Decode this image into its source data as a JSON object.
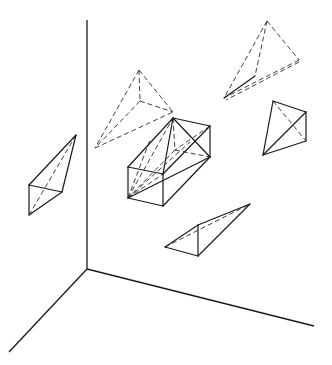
{
  "diagram": {
    "colors": {
      "line": "#1a1a1a",
      "background": "#ffffff"
    },
    "axes": {
      "origin": [
        87,
        269
      ],
      "vertical_top": [
        87,
        20
      ],
      "left_end": [
        9,
        352
      ],
      "right_end": [
        314,
        326
      ]
    },
    "shapes": [
      {
        "id": "left-tetrahedron",
        "solid": [
          [
            [
              76,
              135
            ],
            [
              29,
              185
            ]
          ],
          [
            [
              29,
              185
            ],
            [
              62,
              192
            ]
          ],
          [
            [
              62,
              192
            ],
            [
              76,
              135
            ]
          ],
          [
            [
              29,
              185
            ],
            [
              29,
              215
            ]
          ],
          [
            [
              29,
              215
            ],
            [
              62,
              192
            ]
          ]
        ],
        "dashed": [
          [
            [
              76,
              135
            ],
            [
              29,
              215
            ]
          ]
        ]
      },
      {
        "id": "dashed-tetrahedron-center",
        "solid": [],
        "dashed": [
          [
            [
              139,
              70
            ],
            [
              140,
              101
            ]
          ],
          [
            [
              139,
              70
            ],
            [
              173,
              112
            ]
          ],
          [
            [
              139,
              70
            ],
            [
              95,
              148
            ]
          ],
          [
            [
              140,
              101
            ],
            [
              173,
              112
            ]
          ],
          [
            [
              140,
              101
            ],
            [
              95,
              148
            ]
          ],
          [
            [
              95,
              148
            ],
            [
              173,
              112
            ]
          ]
        ]
      },
      {
        "id": "top-right-tetrahedron",
        "solid": [
          [
            [
              255,
              76
            ],
            [
              224,
              98
            ]
          ]
        ],
        "dashed": [
          [
            [
              267,
              21
            ],
            [
              299,
              60
            ]
          ],
          [
            [
              267,
              21
            ],
            [
              255,
              76
            ]
          ],
          [
            [
              267,
              21
            ],
            [
              224,
              98
            ]
          ],
          [
            [
              299,
              60
            ],
            [
              224,
              98
            ]
          ],
          [
            [
              299,
              62
            ],
            [
              226,
              100
            ]
          ]
        ]
      },
      {
        "id": "right-kite",
        "solid": [
          [
            [
              273,
              101
            ],
            [
              306,
              112
            ]
          ],
          [
            [
              306,
              112
            ],
            [
              306,
              141
            ]
          ],
          [
            [
              273,
              101
            ],
            [
              263,
              155
            ]
          ],
          [
            [
              306,
              112
            ],
            [
              263,
              155
            ]
          ],
          [
            [
              306,
              141
            ],
            [
              263,
              155
            ]
          ]
        ],
        "dashed": [
          [
            [
              273,
              101
            ],
            [
              306,
              141
            ]
          ]
        ]
      },
      {
        "id": "bottom-wedge",
        "solid": [
          [
            [
              165,
              247
            ],
            [
              198,
              225
            ]
          ],
          [
            [
              198,
              225
            ],
            [
              250,
              204
            ]
          ],
          [
            [
              165,
              247
            ],
            [
              198,
              256
            ]
          ],
          [
            [
              198,
              256
            ],
            [
              198,
              225
            ]
          ],
          [
            [
              198,
              256
            ],
            [
              250,
              204
            ]
          ]
        ],
        "dashed": [
          [
            [
              165,
              247
            ],
            [
              250,
              204
            ]
          ]
        ]
      },
      {
        "id": "central-box",
        "solid": [
          [
            [
              128,
              167
            ],
            [
              163,
              174
            ]
          ],
          [
            [
              163,
              174
            ],
            [
              163,
              206
            ]
          ],
          [
            [
              163,
              206
            ],
            [
              128,
              198
            ]
          ],
          [
            [
              128,
              198
            ],
            [
              128,
              167
            ]
          ],
          [
            [
              128,
              167
            ],
            [
              173,
              118
            ]
          ],
          [
            [
              173,
              118
            ],
            [
              210,
              126
            ]
          ],
          [
            [
              210,
              126
            ],
            [
              163,
              174
            ]
          ],
          [
            [
              210,
              126
            ],
            [
              210,
              157
            ]
          ],
          [
            [
              210,
              157
            ],
            [
              163,
              206
            ]
          ],
          [
            [
              173,
              118
            ],
            [
              163,
              174
            ]
          ],
          [
            [
              128,
              198
            ],
            [
              210,
              157
            ]
          ],
          [
            [
              173,
              118
            ],
            [
              210,
              157
            ]
          ]
        ],
        "dashed": [
          [
            [
              173,
              118
            ],
            [
              175,
              150
            ]
          ],
          [
            [
              175,
              150
            ],
            [
              210,
              157
            ]
          ],
          [
            [
              175,
              150
            ],
            [
              128,
              198
            ]
          ],
          [
            [
              210,
              126
            ],
            [
              175,
              150
            ]
          ],
          [
            [
              128,
              198
            ],
            [
              173,
              118
            ]
          ],
          [
            [
              128,
              198
            ],
            [
              150,
              140
            ]
          ],
          [
            [
              128,
              198
            ],
            [
              163,
              174
            ]
          ],
          [
            [
              128,
              198
            ],
            [
              190,
              142
            ]
          ]
        ]
      }
    ]
  }
}
